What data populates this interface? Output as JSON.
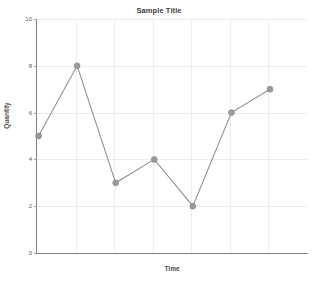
{
  "chart_data": {
    "type": "line",
    "title": "Sample Title",
    "xlabel": "Time",
    "ylabel": "Quantity",
    "x": [
      1,
      2,
      3,
      4,
      5,
      6,
      7
    ],
    "values": [
      5,
      8,
      3,
      4,
      2,
      6,
      7
    ],
    "series": [
      {
        "name": "Quantity",
        "values": [
          5,
          8,
          3,
          4,
          2,
          6,
          7
        ]
      }
    ],
    "ylim": [
      0,
      10
    ],
    "yticks": [
      0,
      2,
      4,
      6,
      8,
      10
    ],
    "ytick_labels": [
      "0",
      "2",
      "4",
      "6",
      "8",
      "10"
    ],
    "xticks": [],
    "xtick_labels": [],
    "grid": true,
    "legend": false,
    "legend_position": "none",
    "line_color": "#919191",
    "marker_color": "#9b9b9b",
    "marker": "circle",
    "grid_color": "#ececec",
    "axis_color": "#808080",
    "background_color": "#ffffff"
  }
}
